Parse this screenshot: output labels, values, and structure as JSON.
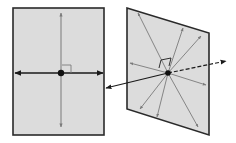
{
  "diagram": {
    "title": "Line perpendicular to a plane",
    "colors": {
      "panel_fill": "#dcdcdc",
      "panel_stroke": "#2a2a2a",
      "axis_line": "#1a1a1a",
      "in_plane_line": "#7a7a7a",
      "point": "#111111",
      "background": "#ffffff"
    },
    "left_panel": {
      "label": "Front view of plane",
      "rect": {
        "x": 13,
        "y": 8,
        "w": 91,
        "h": 127
      },
      "center": {
        "x": 61,
        "y": 73
      },
      "horizontal_line": {
        "x1": 15,
        "x2": 103,
        "y": 73
      },
      "vertical_line": {
        "x": 61,
        "y1": 13,
        "y2": 127
      },
      "right_angle_box": {
        "x": 62,
        "y": 65,
        "size": 9
      }
    },
    "right_panel": {
      "label": "Oblique view of plane",
      "corners": [
        [
          127,
          8
        ],
        [
          209,
          33
        ],
        [
          209,
          135
        ],
        [
          127,
          109
        ]
      ],
      "center": {
        "x": 168,
        "y": 73
      },
      "in_plane_rays": [
        [
          138,
          13
        ],
        [
          183,
          28
        ],
        [
          201,
          36
        ],
        [
          130,
          63
        ],
        [
          206,
          85
        ],
        [
          198,
          127
        ],
        [
          157,
          117
        ],
        [
          140,
          109
        ]
      ],
      "normal_line": {
        "back_tip": {
          "x": 106,
          "y": 88
        },
        "front_tip": {
          "x": 226,
          "y": 61
        }
      },
      "right_angle_marker": [
        [
          159,
          68
        ],
        [
          161,
          60
        ],
        [
          171,
          58
        ],
        [
          169,
          66
        ]
      ]
    }
  }
}
